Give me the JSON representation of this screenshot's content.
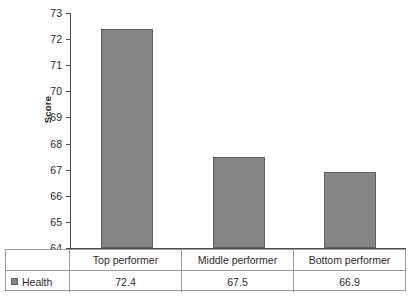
{
  "chart_data": {
    "type": "bar",
    "title": "",
    "subtitle": "",
    "xlabel": "",
    "ylabel": "Score",
    "ylim": [
      64,
      73
    ],
    "ytick_step": 1,
    "yticks": [
      73,
      72,
      71,
      70,
      69,
      68,
      67,
      66,
      65,
      64
    ],
    "grid": false,
    "categories": [
      "Top performer",
      "Middle performer",
      "Bottom performer"
    ],
    "series": [
      {
        "name": "Health",
        "values": [
          72.4,
          67.5,
          66.9
        ],
        "color": "#858585",
        "border_color": "#5e5e5e"
      }
    ],
    "legend_position": "data-table-left",
    "data_table": {
      "visible": true,
      "row_label": "Health",
      "header": [
        "Top performer",
        "Middle performer",
        "Bottom performer"
      ],
      "values": [
        "72.4",
        "67.5",
        "66.9"
      ]
    },
    "annotations": []
  },
  "axis": {
    "y_title": "Score",
    "y_tick_labels": [
      "73",
      "72",
      "71",
      "70",
      "69",
      "68",
      "67",
      "66",
      "65",
      "64"
    ]
  },
  "legend": {
    "series_name": "Health",
    "swatch_color": "#858585"
  },
  "table": {
    "headers": [
      "Top performer",
      "Middle performer",
      "Bottom performer"
    ],
    "values": [
      "72.4",
      "67.5",
      "66.9"
    ]
  }
}
